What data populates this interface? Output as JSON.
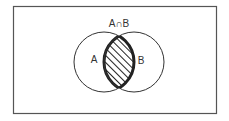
{
  "diagram": {
    "type": "venn",
    "title": "A∩B",
    "sets": [
      {
        "label": "A"
      },
      {
        "label": "B"
      }
    ],
    "highlighted_region": "A∩B",
    "highlight_style": "hatched",
    "colors": {
      "stroke": "#333333",
      "background": "#ffffff"
    }
  }
}
